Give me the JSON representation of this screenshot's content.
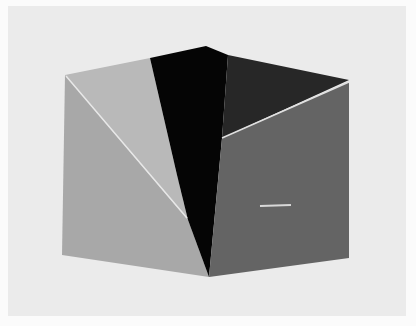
{
  "image": {
    "subject": "geometric cube-like polygon composition",
    "colors": {
      "outer_border": "#fbfbfb",
      "background": "#ebebeb",
      "top_left_face": "#b8b8b8",
      "left_face": "#a6a6a6",
      "center_black_face": "#050505",
      "top_right_face": "#262626",
      "right_face": "#636363",
      "highlight_lines": "#e6e6e6"
    }
  }
}
